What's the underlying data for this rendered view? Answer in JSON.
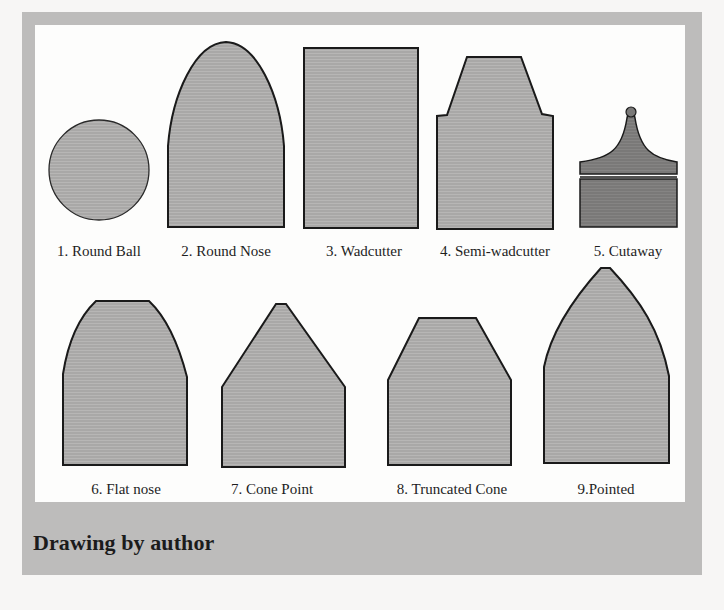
{
  "figure": {
    "caption": "Drawing by author",
    "colors": {
      "frame": "#bdbcbb",
      "panel": "#fdfdfc",
      "shape_fill": "#a9a8a7",
      "shape_fill_dark": "#7a7978",
      "outline": "#1a1a1a"
    },
    "shapes": [
      {
        "id": 1,
        "label": "1. Round Ball",
        "icon": "round-ball-bullet-icon"
      },
      {
        "id": 2,
        "label": "2. Round Nose",
        "icon": "round-nose-bullet-icon"
      },
      {
        "id": 3,
        "label": "3. Wadcutter",
        "icon": "wadcutter-bullet-icon"
      },
      {
        "id": 4,
        "label": "4.  Semi-wadcutter",
        "icon": "semi-wadcutter-bullet-icon"
      },
      {
        "id": 5,
        "label": "5. Cutaway",
        "icon": "cutaway-bullet-icon"
      },
      {
        "id": 6,
        "label": "6. Flat nose",
        "icon": "flat-nose-bullet-icon"
      },
      {
        "id": 7,
        "label": "7. Cone Point",
        "icon": "cone-point-bullet-icon"
      },
      {
        "id": 8,
        "label": "8. Truncated Cone",
        "icon": "truncated-cone-bullet-icon"
      },
      {
        "id": 9,
        "label": "9.Pointed",
        "icon": "pointed-bullet-icon"
      }
    ]
  }
}
